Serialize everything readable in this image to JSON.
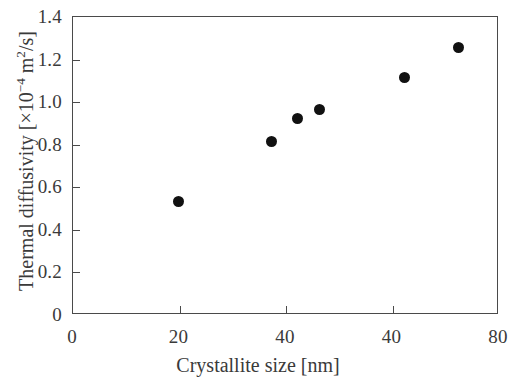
{
  "chart_data": {
    "type": "scatter",
    "title": "",
    "xlabel": "Crystallite size [nm]",
    "ylabel": "Thermal diffusivity [×10⁻⁴ m²/s]",
    "ylabel_parts": {
      "prefix": "Thermal diffusivity [×10",
      "exponent": "−4",
      "suffix_m": " m",
      "exponent2": "2",
      "suffix_tail": "/s]"
    },
    "xlim": [
      0,
      80
    ],
    "ylim": [
      0,
      1.4
    ],
    "grid": false,
    "legend": null,
    "marker": "filled-circle",
    "marker_color": "#111111",
    "axis_color": "#4a4a4a",
    "background": "#ffffff",
    "xticks": [
      0,
      20,
      40,
      60,
      80
    ],
    "xtick_labels": [
      "0",
      "20",
      "40",
      "40",
      "80"
    ],
    "yticks": [
      0,
      0.2,
      0.4,
      0.6,
      0.8,
      1.0,
      1.2,
      1.4
    ],
    "ytick_labels": [
      "0",
      "0.2",
      "0.4",
      "0.6",
      "0.8",
      "1.0",
      "1.2",
      "1.4"
    ],
    "x": [
      20.0,
      37.5,
      42.3,
      46.4,
      62.5,
      72.5
    ],
    "y": [
      0.53,
      0.81,
      0.92,
      0.96,
      1.11,
      1.25
    ],
    "points": [
      {
        "x": 20.0,
        "y": 0.53
      },
      {
        "x": 37.5,
        "y": 0.81
      },
      {
        "x": 42.3,
        "y": 0.92
      },
      {
        "x": 46.4,
        "y": 0.96
      },
      {
        "x": 62.5,
        "y": 1.11
      },
      {
        "x": 72.5,
        "y": 1.25
      }
    ]
  }
}
